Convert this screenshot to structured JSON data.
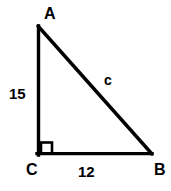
{
  "figure": {
    "background_color": "#ffffff",
    "stroke_color": "#000000",
    "stroke_width": 3,
    "vertices": [
      {
        "name": "A",
        "label": "A",
        "x": 37,
        "y": 26,
        "label_x": 44,
        "label_y": 6
      },
      {
        "name": "B",
        "label": "B",
        "x": 152,
        "y": 155,
        "label_x": 154,
        "label_y": 162
      },
      {
        "name": "C",
        "label": "C",
        "x": 37,
        "y": 155,
        "label_x": 26,
        "label_y": 162
      }
    ],
    "right_angle": {
      "at_vertex": "C",
      "marker": "square",
      "size": 12
    },
    "sides": [
      {
        "name": "leg-AC",
        "from": "A",
        "to": "C",
        "label": "15",
        "label_x": 9,
        "label_y": 86,
        "orientation": "vertical"
      },
      {
        "name": "leg-CB",
        "from": "C",
        "to": "B",
        "label": "12",
        "label_x": 78,
        "label_y": 164,
        "orientation": "horizontal"
      },
      {
        "name": "hypotenuse-AB",
        "from": "A",
        "to": "B",
        "label": "c",
        "label_x": 104,
        "label_y": 73,
        "orientation": "diagonal"
      }
    ]
  }
}
